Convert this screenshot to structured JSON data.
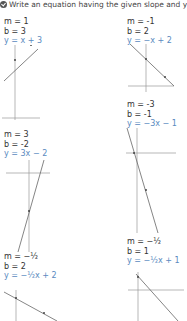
{
  "header": {
    "icon": "check-circle-icon",
    "text": "Write an equation having the given slope and y-in"
  },
  "problems": [
    {
      "m_label": "m = 1",
      "b_label": "b = 3",
      "eq": "y = x + 3",
      "slope": 1,
      "intercept": 3
    },
    {
      "m_label": "m = -1",
      "b_label": "b = 2",
      "eq": "y = −x + 2",
      "slope": -1,
      "intercept": 2
    },
    {
      "m_label": "m = 3",
      "b_label": "b = -2",
      "eq": "y = 3x − 2",
      "slope": 3,
      "intercept": -2
    },
    {
      "m_label": "m = -3",
      "b_label": "b = -1",
      "eq": "y = −3x − 1",
      "slope": -3,
      "intercept": -1
    },
    {
      "m_label": "m = −½",
      "b_label": "b = 2",
      "eq": "y = −½x + 2",
      "slope": -0.5,
      "intercept": 2
    },
    {
      "m_label": "m = −½",
      "b_label": "b = 1",
      "eq": "y = −½x + 1",
      "slope": -0.5,
      "intercept": 1
    }
  ],
  "colors": {
    "equation": "#5a8ac0",
    "text": "#333333",
    "axis": "#888888",
    "line": "#555555"
  }
}
